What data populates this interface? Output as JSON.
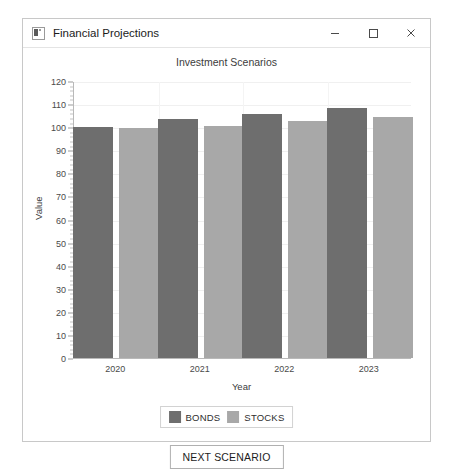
{
  "window": {
    "title": "Financial Projections",
    "app_icon": "app-window-icon",
    "controls": {
      "minimize": "minimize-icon",
      "maximize": "maximize-icon",
      "close": "close-icon"
    }
  },
  "colors": {
    "bonds": "#6e6e6e",
    "stocks": "#a8a8a8",
    "axis": "#b9b9b9",
    "grid": "#f0f0f0",
    "window_border": "#c8c8c8",
    "text": "#3c3c3c"
  },
  "controls": {
    "next_scenario_label": "NEXT SCENARIO"
  },
  "chart_data": {
    "type": "bar",
    "title": "Investment Scenarios",
    "xlabel": "Year",
    "ylabel": "Value",
    "categories": [
      "2020",
      "2021",
      "2022",
      "2023"
    ],
    "series": [
      {
        "name": "BONDS",
        "color": "#6e6e6e",
        "values": [
          100.0,
          103.5,
          105.5,
          108.5
        ]
      },
      {
        "name": "STOCKS",
        "color": "#a8a8a8",
        "values": [
          99.5,
          100.5,
          102.5,
          104.5
        ]
      }
    ],
    "ylim": [
      0,
      120
    ],
    "yticks": [
      0,
      10,
      20,
      30,
      40,
      50,
      60,
      70,
      80,
      90,
      100,
      110,
      120
    ],
    "ytick_labels": [
      "0",
      "10",
      "20",
      "30",
      "40",
      "50",
      "60",
      "70",
      "80",
      "90",
      "100",
      "110",
      "120"
    ],
    "grid": true,
    "legend_position": "bottom-center"
  }
}
